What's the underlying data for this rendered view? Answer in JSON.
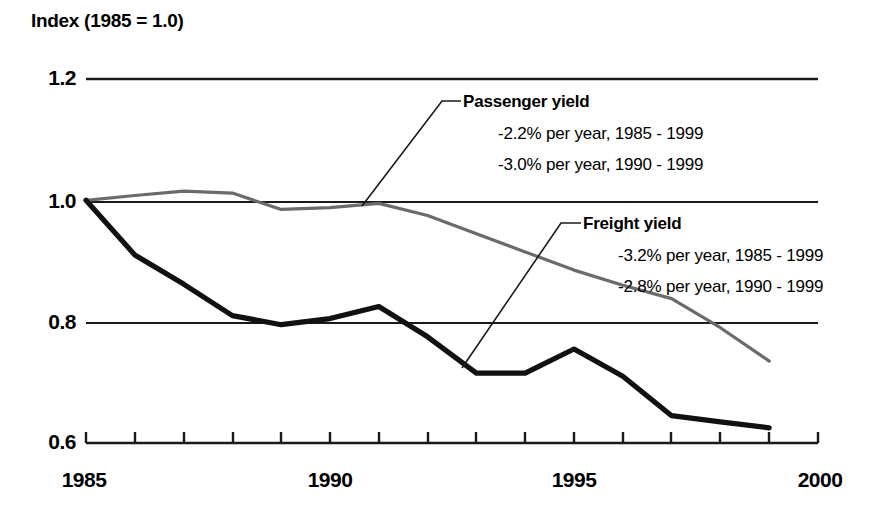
{
  "chart_data": {
    "type": "line",
    "title": "Index (1985 = 1.0)",
    "xlabel": "",
    "ylabel": "",
    "xlim": [
      1985,
      2000
    ],
    "ylim": [
      0.6,
      1.2
    ],
    "grid": true,
    "legend_position": "inline-annotations",
    "x": [
      1985,
      1986,
      1987,
      1988,
      1989,
      1990,
      1991,
      1992,
      1993,
      1994,
      1995,
      1996,
      1997,
      1998,
      1999
    ],
    "y_ticks": [
      "1.2",
      "1.0",
      "0.8",
      "0.6"
    ],
    "y_tick_values": [
      1.2,
      1.0,
      0.8,
      0.6
    ],
    "x_ticks": [
      "1985",
      "1990",
      "1995",
      "2000"
    ],
    "x_tick_values": [
      1985,
      1990,
      1995,
      2000
    ],
    "series": [
      {
        "name": "Passenger yield",
        "color": "#6b6b6b",
        "values": [
          1.0,
          1.008,
          1.015,
          1.012,
          0.985,
          0.988,
          0.995,
          0.975,
          0.945,
          0.915,
          0.885,
          0.86,
          0.838,
          0.79,
          0.735
        ]
      },
      {
        "name": "Freight yield",
        "color": "#111111",
        "values": [
          1.0,
          0.91,
          0.862,
          0.81,
          0.795,
          0.805,
          0.825,
          0.775,
          0.715,
          0.715,
          0.755,
          0.71,
          0.645,
          0.635,
          0.625
        ]
      }
    ],
    "annotations": [
      {
        "id": "passenger",
        "title": "Passenger yield",
        "lines": [
          "-2.2% per year, 1985 - 1999",
          "-3.0% per year, 1990 - 1999"
        ]
      },
      {
        "id": "freight",
        "title": "Freight yield",
        "lines": [
          "-3.2% per year, 1985 - 1999",
          "-2.8% per year, 1990 - 1999"
        ]
      }
    ]
  }
}
